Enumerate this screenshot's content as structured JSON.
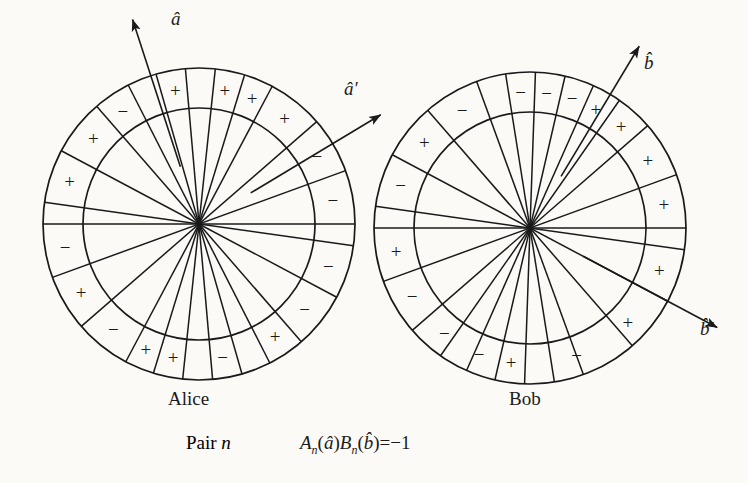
{
  "figure": {
    "background_color": "#fbfaf7",
    "ink_color": "#1a1a1a",
    "caption": {
      "pair_prefix": "Pair ",
      "pair_index": "n",
      "formula_text": "Aₙ(â)Bₙ(b̂)=−1"
    },
    "parties": [
      {
        "id": "alice",
        "name": "Alice",
        "name_x": 168,
        "name_y": 388,
        "center": {
          "x": 199,
          "y": 224
        },
        "outer_radius": 156,
        "inner_radius": 116,
        "spoke_angles_deg": [
          0,
          20,
          41,
          62,
          73,
          84,
          95,
          106,
          117,
          131,
          152,
          172
        ],
        "outer_ring_signs": [
          {
            "angle_deg": 10,
            "sign": "−"
          },
          {
            "angle_deg": 30,
            "sign": "−"
          },
          {
            "angle_deg": 51,
            "sign": "+"
          },
          {
            "angle_deg": 67,
            "sign": "+"
          },
          {
            "angle_deg": 79,
            "sign": "+"
          },
          {
            "angle_deg": 100,
            "sign": "+"
          },
          {
            "angle_deg": 124,
            "sign": "−"
          },
          {
            "angle_deg": 141,
            "sign": "+"
          },
          {
            "angle_deg": 162,
            "sign": "+"
          },
          {
            "angle_deg": 190,
            "sign": "−"
          },
          {
            "angle_deg": 210,
            "sign": "+"
          },
          {
            "angle_deg": 231,
            "sign": "−"
          },
          {
            "angle_deg": 247,
            "sign": "+"
          },
          {
            "angle_deg": 259,
            "sign": "+"
          },
          {
            "angle_deg": 280,
            "sign": "−"
          },
          {
            "angle_deg": 304,
            "sign": "+"
          },
          {
            "angle_deg": 321,
            "sign": "−"
          },
          {
            "angle_deg": 342,
            "sign": "−"
          }
        ],
        "vectors": [
          {
            "id": "a-hat",
            "label": "â",
            "angle_deg": 108,
            "tip_radius": 215,
            "label_x": 171,
            "label_y": 8
          },
          {
            "id": "a-prime-hat",
            "label": "â′",
            "angle_deg": 31,
            "tip_radius": 212,
            "label_x": 344,
            "label_y": 78
          }
        ]
      },
      {
        "id": "bob",
        "name": "Bob",
        "name_x": 509,
        "name_y": 388,
        "center": {
          "x": 530,
          "y": 228
        },
        "outer_radius": 156,
        "inner_radius": 116,
        "spoke_angles_deg": [
          0,
          20,
          41,
          55,
          66,
          77,
          88,
          99,
          110,
          131,
          152,
          172
        ],
        "outer_ring_signs": [
          {
            "angle_deg": 10,
            "sign": "+"
          },
          {
            "angle_deg": 30,
            "sign": "+"
          },
          {
            "angle_deg": 48,
            "sign": "+"
          },
          {
            "angle_deg": 61,
            "sign": "+"
          },
          {
            "angle_deg": 72,
            "sign": "−"
          },
          {
            "angle_deg": 83,
            "sign": "−"
          },
          {
            "angle_deg": 94,
            "sign": "−"
          },
          {
            "angle_deg": 120,
            "sign": "−"
          },
          {
            "angle_deg": 141,
            "sign": "+"
          },
          {
            "angle_deg": 162,
            "sign": "−"
          },
          {
            "angle_deg": 190,
            "sign": "+"
          },
          {
            "angle_deg": 210,
            "sign": "−"
          },
          {
            "angle_deg": 231,
            "sign": "−"
          },
          {
            "angle_deg": 248,
            "sign": "−"
          },
          {
            "angle_deg": 262,
            "sign": "+"
          },
          {
            "angle_deg": 290,
            "sign": "−"
          },
          {
            "angle_deg": 316,
            "sign": "+"
          },
          {
            "angle_deg": 342,
            "sign": "+"
          }
        ],
        "vectors": [
          {
            "id": "b-hat",
            "label": "b̂",
            "angle_deg": 59,
            "tip_radius": 212,
            "label_x": 644,
            "label_y": 52
          },
          {
            "id": "b-prime-hat",
            "label": "b̂′",
            "angle_deg": -28,
            "tip_radius": 212,
            "label_x": 700,
            "label_y": 318
          }
        ]
      }
    ]
  }
}
